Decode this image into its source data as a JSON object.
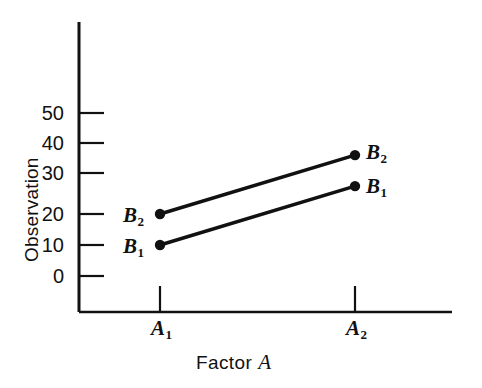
{
  "figure": {
    "background_color": "#ffffff",
    "ink_color": "#111111"
  },
  "chart_data": {
    "type": "line",
    "title": "",
    "subtitle": "",
    "xlabel_text": "Factor",
    "xlabel_variable": "A",
    "ylabel": "Observation",
    "categories": [
      "A₁",
      "A₂"
    ],
    "x": [
      1,
      2
    ],
    "xtick_labels": [
      "A",
      "A"
    ],
    "xtick_subscripts": [
      "1",
      "2"
    ],
    "ytick_labels": [
      "0",
      "10",
      "20",
      "30",
      "40",
      "50"
    ],
    "ytick_values": [
      0,
      10,
      20,
      30,
      40,
      50
    ],
    "ylim": [
      0,
      58
    ],
    "xlim": [
      0.5,
      2.5
    ],
    "grid": false,
    "legend_position": "inline-endpoint-labels",
    "marker": "filled-circle",
    "series": [
      {
        "name": "B₁",
        "label_base": "B",
        "label_subscript": "1",
        "values": [
          10,
          29
        ],
        "color": "#111111",
        "left_label": "B",
        "left_label_subscript": "1",
        "right_label": "B",
        "right_label_subscript": "1"
      },
      {
        "name": "B₂",
        "label_base": "B",
        "label_subscript": "2",
        "values": [
          20,
          39
        ],
        "color": "#111111",
        "left_label": "B",
        "left_label_subscript": "2",
        "right_label": "B",
        "right_label_subscript": "2"
      }
    ],
    "annotations": []
  },
  "axis": {
    "y_tick_0": "0",
    "y_tick_10": "10",
    "y_tick_20": "20",
    "y_tick_30": "30",
    "y_tick_40": "40",
    "y_tick_50": "50",
    "x_tick_1_base": "A",
    "x_tick_1_sub": "1",
    "x_tick_2_base": "A",
    "x_tick_2_sub": "2",
    "x_title_word": "Factor",
    "x_title_var": "A",
    "y_title": "Observation"
  },
  "point_labels": {
    "left_upper_base": "B",
    "left_upper_sub": "2",
    "left_lower_base": "B",
    "left_lower_sub": "1",
    "right_upper_base": "B",
    "right_upper_sub": "2",
    "right_lower_base": "B",
    "right_lower_sub": "1"
  }
}
